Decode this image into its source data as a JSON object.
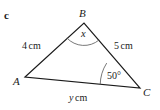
{
  "figure": {
    "part_label": "c",
    "type": "triangle-diagram",
    "background_color": "#ffffff",
    "stroke_color": "#1a1a1a",
    "vertices": [
      {
        "name": "vertex-b",
        "label": "B",
        "x": 84,
        "y": 23
      },
      {
        "name": "vertex-a",
        "label": "A",
        "x": 25,
        "y": 77
      },
      {
        "name": "vertex-c",
        "label": "C",
        "x": 140,
        "y": 88
      }
    ],
    "sides": [
      {
        "name": "side-ab",
        "from": "A",
        "to": "B",
        "number": "4",
        "unit": "cm",
        "text": "4 cm"
      },
      {
        "name": "side-bc",
        "from": "B",
        "to": "C",
        "number": "5",
        "unit": "cm",
        "text": "5 cm"
      },
      {
        "name": "side-ac",
        "from": "A",
        "to": "C",
        "variable": "y",
        "unit": "cm",
        "text": "y cm"
      }
    ],
    "angles": [
      {
        "name": "angle-b",
        "at": "B",
        "label": "x",
        "marked": true
      },
      {
        "name": "angle-c",
        "at": "C",
        "label": "50°",
        "marked": true
      }
    ]
  }
}
